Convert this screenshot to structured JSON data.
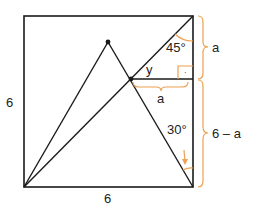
{
  "diagram": {
    "labels": {
      "left_side": "6",
      "bottom_side": "6",
      "angle_top": "45°",
      "angle_y": "y",
      "segment_a_horizontal": "a",
      "segment_a_vertical": "a",
      "segment_remaining": "6 – a",
      "angle_bottom": "30°",
      "right_angle_marker": "·"
    },
    "colors": {
      "line": "#1a1a1a",
      "accent": "#f0a050",
      "text": "#222222"
    }
  }
}
